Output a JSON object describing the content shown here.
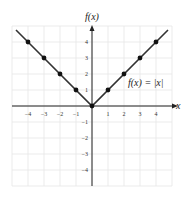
{
  "chart_data": {
    "type": "line",
    "title": "",
    "function_label": "f(x) = |x|",
    "xlabel": "x",
    "ylabel": "f(x)",
    "xlim": [
      -5,
      5
    ],
    "ylim": [
      -5,
      5
    ],
    "grid": true,
    "x_ticks": [
      -4,
      -3,
      -2,
      -1,
      1,
      2,
      3,
      4
    ],
    "y_ticks": [
      4,
      3,
      2,
      1,
      -1,
      -2,
      -3,
      -4
    ],
    "series": [
      {
        "name": "f(x) = |x|",
        "x": [
          -4,
          -3,
          -2,
          -1,
          0,
          1,
          2,
          3,
          4
        ],
        "y": [
          4,
          3,
          2,
          1,
          0,
          1,
          2,
          3,
          4
        ],
        "markers": true
      }
    ],
    "line_extends": {
      "from": [
        -4.75,
        4.75
      ],
      "to": [
        4.75,
        4.75
      ]
    },
    "colors": {
      "line": "#333333",
      "grid": "#e6e6e6",
      "axis": "#222222"
    }
  }
}
